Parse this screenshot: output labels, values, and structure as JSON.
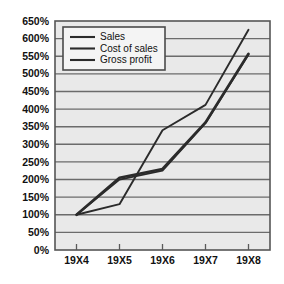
{
  "chart_data": {
    "type": "line",
    "title": "",
    "xlabel": "",
    "ylabel": "",
    "categories": [
      "19X4",
      "19X5",
      "19X6",
      "19X7",
      "19X8"
    ],
    "ylim": [
      0,
      650
    ],
    "y_tick_labels": [
      "0%",
      "50%",
      "100%",
      "150%",
      "200%",
      "250%",
      "300%",
      "350%",
      "400%",
      "450%",
      "500%",
      "550%",
      "600%",
      "650%"
    ],
    "y_tick_values": [
      0,
      50,
      100,
      150,
      200,
      250,
      300,
      350,
      400,
      450,
      500,
      550,
      600,
      650
    ],
    "y_unit": "%",
    "grid": true,
    "legend_position": "top-left",
    "series": [
      {
        "name": "Sales",
        "values": [
          100,
          200,
          225,
          360,
          555
        ]
      },
      {
        "name": "Cost of sales",
        "values": [
          100,
          205,
          230,
          362,
          557
        ]
      },
      {
        "name": "Gross profit",
        "values": [
          100,
          130,
          340,
          412,
          625
        ]
      }
    ]
  },
  "legend": {
    "entries": [
      {
        "label": "Sales"
      },
      {
        "label": "Cost of sales"
      },
      {
        "label": "Gross profit"
      }
    ]
  },
  "colors": {
    "line": "#2b2b2b",
    "grid": "#6b6b6b",
    "plot_background": "#e9e9e9",
    "page_background": "#ffffff"
  }
}
